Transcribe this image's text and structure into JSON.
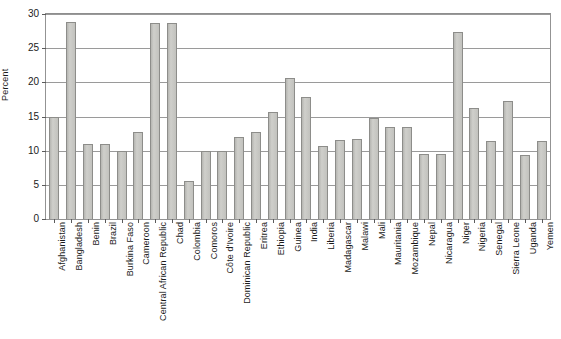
{
  "chart_data": {
    "type": "bar",
    "title": "",
    "subtitle": "",
    "xlabel": "",
    "ylabel": "Percent",
    "ylim": [
      0,
      30
    ],
    "yticks": [
      0,
      5,
      10,
      15,
      20,
      25,
      30
    ],
    "ytick_labels": [
      "0",
      "5",
      "10",
      "15",
      "20",
      "25",
      "30"
    ],
    "grid": true,
    "legend": false,
    "legend_position": "none",
    "categories": [
      "Afghanistan",
      "Bangladesh",
      "Benin",
      "Brazil",
      "Burkina Faso",
      "Cameroon",
      "Central African Republic",
      "Chad",
      "Colombia",
      "Comoros",
      "Côte d'Ivoire",
      "Dominican Republic",
      "Eritrea",
      "Ethiopia",
      "Guinea",
      "India",
      "Liberia",
      "Madagascar",
      "Malawi",
      "Mali",
      "Mauritania",
      "Mozambique",
      "Nepal",
      "Nicaragua",
      "Niger",
      "Nigeria",
      "Senegal",
      "Sierra Leone",
      "Uganda",
      "Yemen"
    ],
    "values": [
      14.9,
      28.9,
      11.0,
      11.0,
      9.9,
      12.8,
      28.7,
      28.7,
      5.5,
      9.9,
      9.9,
      12.0,
      12.7,
      15.7,
      20.7,
      17.8,
      10.7,
      11.6,
      11.7,
      14.8,
      13.5,
      13.5,
      9.5,
      9.5,
      27.4,
      16.3,
      11.4,
      17.3,
      9.4,
      11.4
    ],
    "colors": {
      "bar_fill": "#c6c6c2",
      "bar_border": "#8d8d8a",
      "gridline": "#9a9a9a",
      "frame": "#939393",
      "text": "#1b1b1b",
      "background": "#ffffff"
    }
  }
}
